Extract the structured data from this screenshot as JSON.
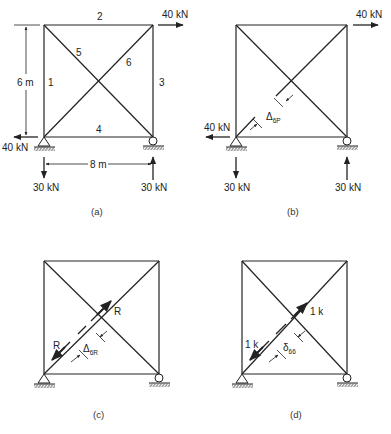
{
  "figure": {
    "caption": "",
    "panels": [
      {
        "id": "a",
        "label": "(a)",
        "members": [
          {
            "id": "1",
            "label": "1"
          },
          {
            "id": "2",
            "label": "2"
          },
          {
            "id": "3",
            "label": "3"
          },
          {
            "id": "4",
            "label": "4"
          },
          {
            "id": "5",
            "label": "5"
          },
          {
            "id": "6",
            "label": "6"
          }
        ],
        "loads": {
          "top_right": "40 kN",
          "bottom_left_horizontal": "40 kN",
          "left_reaction": "30 kN",
          "right_reaction": "30 kN"
        },
        "dimensions": {
          "height": "6 m",
          "width": "8 m"
        }
      },
      {
        "id": "b",
        "label": "(b)",
        "loads": {
          "top_right": "40 kN",
          "bottom_left_horizontal": "40 kN",
          "left_reaction": "30 kN",
          "right_reaction": "30 kN"
        },
        "gap_symbol": "Δ",
        "gap_subscript": "6P"
      },
      {
        "id": "c",
        "label": "(c)",
        "force_upper": "R",
        "force_lower": "R",
        "gap_symbol": "Δ",
        "gap_subscript": "6R"
      },
      {
        "id": "d",
        "label": "(d)",
        "force_upper": "1 k",
        "force_lower": "1 k",
        "gap_symbol": "δ",
        "gap_subscript": "66"
      }
    ]
  }
}
